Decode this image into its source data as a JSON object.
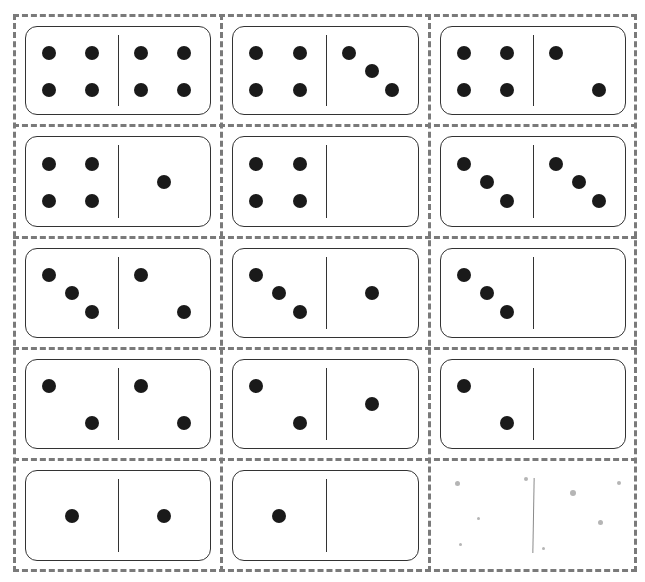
{
  "sheet": {
    "rows": 5,
    "cols": 3,
    "border_color": "#7a7a7a",
    "pip_color": "#1a1a1a"
  },
  "dominoes": [
    {
      "row": 0,
      "col": 0,
      "left": 4,
      "right": 4
    },
    {
      "row": 0,
      "col": 1,
      "left": 4,
      "right": 3
    },
    {
      "row": 0,
      "col": 2,
      "left": 4,
      "right": 2
    },
    {
      "row": 1,
      "col": 0,
      "left": 4,
      "right": 1
    },
    {
      "row": 1,
      "col": 1,
      "left": 4,
      "right": 0
    },
    {
      "row": 1,
      "col": 2,
      "left": 3,
      "right": 3
    },
    {
      "row": 2,
      "col": 0,
      "left": 3,
      "right": 2
    },
    {
      "row": 2,
      "col": 1,
      "left": 3,
      "right": 1
    },
    {
      "row": 2,
      "col": 2,
      "left": 3,
      "right": 0
    },
    {
      "row": 3,
      "col": 0,
      "left": 2,
      "right": 2
    },
    {
      "row": 3,
      "col": 1,
      "left": 2,
      "right": 1
    },
    {
      "row": 3,
      "col": 2,
      "left": 2,
      "right": 0
    },
    {
      "row": 4,
      "col": 0,
      "left": 1,
      "right": 1
    },
    {
      "row": 4,
      "col": 1,
      "left": 1,
      "right": 0
    },
    {
      "row": 4,
      "col": 2,
      "left": 0,
      "right": 0,
      "faint": true
    }
  ]
}
